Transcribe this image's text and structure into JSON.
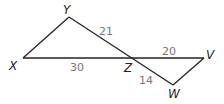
{
  "diagram": {
    "points": {
      "X": "X",
      "Y": "Y",
      "Z": "Z",
      "V": "V",
      "W": "W"
    },
    "lengths": {
      "YZ": "21",
      "XZ": "30",
      "ZV": "20",
      "ZW": "14"
    },
    "colors": {
      "line": "#222222",
      "length_label": "#777777"
    }
  }
}
